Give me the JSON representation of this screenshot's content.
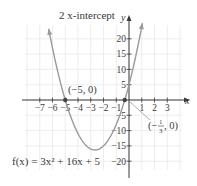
{
  "chart_data": {
    "type": "line",
    "title": "2 x-intercept",
    "function_label": "f(x) = 3x² + 16x + 5",
    "function": {
      "a": 3,
      "b": 16,
      "c": 5
    },
    "xlabel": "x",
    "ylabel": "y",
    "xlim": [
      -8,
      4
    ],
    "ylim": [
      -22,
      25
    ],
    "x_ticks": [
      -7,
      -6,
      -5,
      -4,
      -3,
      -2,
      -1,
      1,
      2,
      3
    ],
    "x_tick_labels": [
      "−7",
      "−6",
      "−5",
      "−4",
      "−3",
      "−2",
      "−1",
      "1",
      "2",
      "3"
    ],
    "y_ticks": [
      20,
      15,
      10,
      5,
      -5,
      -10,
      -15,
      -20
    ],
    "y_tick_labels": [
      "20",
      "15",
      "10",
      "5",
      "−5",
      "−10",
      "−15",
      "−20"
    ],
    "grid": true,
    "series": [
      {
        "name": "f(x) = 3x² + 16x + 5",
        "x": [
          -6.3,
          -6,
          -5.5,
          -5,
          -4.5,
          -4,
          -3.5,
          -3,
          -2.667,
          -2.5,
          -2,
          -1.5,
          -1,
          -0.5,
          -0.333,
          0,
          0.5,
          1.05
        ],
        "y": [
          23.3,
          17,
          7.75,
          0,
          -6.25,
          -11,
          -14.25,
          -16,
          -16.33,
          -16.25,
          -15,
          -12.25,
          -8,
          -2.25,
          0,
          5,
          13.75,
          25.1
        ]
      }
    ],
    "points": [
      {
        "x": -5,
        "y": 0,
        "label": "(−5, 0)"
      },
      {
        "x": -0.333,
        "y": 0,
        "label": "(−1/3, 0)"
      }
    ],
    "annotations": {
      "top": "2 x-intercept",
      "left_point": "(−5, 0)",
      "right_point_num": "1",
      "right_point_den": "3",
      "right_point_prefix": "(−",
      "right_point_suffix": ", 0)"
    },
    "colors": {
      "curve": "#9a9a9a",
      "axis": "#3a3a3a",
      "grid": "#e6e6e6",
      "point": "#444444"
    }
  }
}
